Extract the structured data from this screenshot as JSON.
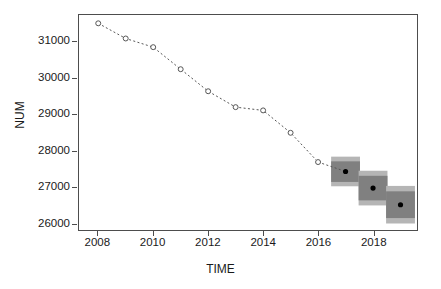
{
  "chart_data": {
    "type": "line",
    "title": "",
    "xlabel": "TIME",
    "ylabel": "NUM",
    "xlim": [
      2007.3,
      2019.6
    ],
    "ylim": [
      25800,
      31750
    ],
    "grid": false,
    "legend": false,
    "x_ticks": [
      2008,
      2010,
      2012,
      2014,
      2016,
      2018
    ],
    "y_ticks": [
      26000,
      27000,
      28000,
      29000,
      30000,
      31000
    ],
    "x_tick_labels": [
      "2008",
      "2010",
      "2012",
      "2014",
      "2016",
      "2018"
    ],
    "y_tick_labels": [
      "26000",
      "27000",
      "28000",
      "29000",
      "30000",
      "31000"
    ],
    "series": [
      {
        "name": "observed",
        "style": "dashed-line-open-circles",
        "x": [
          2008,
          2009,
          2010,
          2011,
          2012,
          2013,
          2014,
          2015,
          2016
        ],
        "values": [
          31520,
          31100,
          30860,
          30250,
          29640,
          29200,
          29110,
          28490,
          27680
        ]
      },
      {
        "name": "forecast",
        "style": "point-with-prediction-intervals",
        "x": [
          2017,
          2018,
          2019
        ],
        "values": [
          27420,
          26960,
          26500
        ],
        "interval_80_lower": [
          27010,
          26480,
          25980
        ],
        "interval_80_upper": [
          27830,
          27440,
          27020
        ],
        "interval_50_lower": [
          27130,
          26620,
          26130
        ],
        "interval_50_upper": [
          27700,
          27300,
          26870
        ]
      }
    ],
    "colors": {
      "line": "#555555",
      "marker_edge": "#555555",
      "marker_face": "#ffffff",
      "forecast_point": "#000000",
      "interval_80": "#b5b5b5",
      "interval_50": "#808080",
      "axis": "#4d4d4d",
      "text": "#1a1a1a",
      "background": "#ffffff"
    }
  }
}
